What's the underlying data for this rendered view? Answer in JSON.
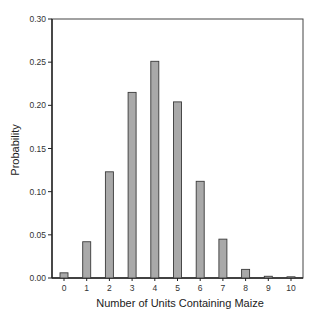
{
  "chart_data": {
    "type": "bar",
    "title": "",
    "xlabel": "Number of Units Containing Maize",
    "ylabel": "Probability",
    "categories": [
      "0",
      "1",
      "2",
      "3",
      "4",
      "5",
      "6",
      "7",
      "8",
      "9",
      "10"
    ],
    "values": [
      0.006,
      0.042,
      0.123,
      0.215,
      0.251,
      0.204,
      0.112,
      0.045,
      0.01,
      0.002,
      0.001
    ],
    "ylim": [
      0,
      0.3
    ],
    "yticks": [
      "0.00",
      "0.05",
      "0.10",
      "0.15",
      "0.20",
      "0.25",
      "0.30"
    ],
    "ytick_values": [
      0,
      0.05,
      0.1,
      0.15,
      0.2,
      0.25,
      0.3
    ],
    "grid": false,
    "legend": "none",
    "bar_color": "#a9a9a9",
    "bar_edge_color": "#3a3a3a"
  }
}
